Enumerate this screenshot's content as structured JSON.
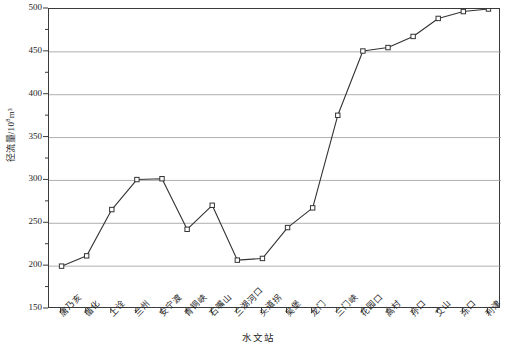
{
  "chart_data": {
    "type": "line",
    "title": "",
    "xlabel": "水文站",
    "ylabel": "径流量/10⁸m³",
    "ylabel_base": "径流量/10",
    "ylabel_exp": "8",
    "ylabel_unit": "m³",
    "ylim": [
      150,
      500
    ],
    "ytick_step": 50,
    "yminor_step": 25,
    "grid": true,
    "grid_axis": "y",
    "legend": "none",
    "marker": "open-square",
    "line_color": "#333333",
    "grid_color": "#9a9a9a",
    "axis_color": "#3a3a3a",
    "yticks": [
      150,
      200,
      250,
      300,
      350,
      400,
      450,
      500
    ],
    "ytick_labels": [
      "150",
      "200",
      "250",
      "300",
      "350",
      "400",
      "450",
      "500"
    ],
    "categories": [
      "唐乃亥",
      "循化",
      "上诠",
      "兰州",
      "安宁渡",
      "青铜峡",
      "石嘴山",
      "三湖河口",
      "头道拐",
      "吴堡",
      "龙门",
      "三门峡",
      "花园口",
      "高村",
      "孙口",
      "艾山",
      "泺口",
      "利津"
    ],
    "values": [
      200,
      212,
      266,
      301,
      302,
      243,
      271,
      207,
      209,
      245,
      268,
      376,
      451,
      455,
      468,
      489,
      497,
      500
    ],
    "n_points": 18
  }
}
